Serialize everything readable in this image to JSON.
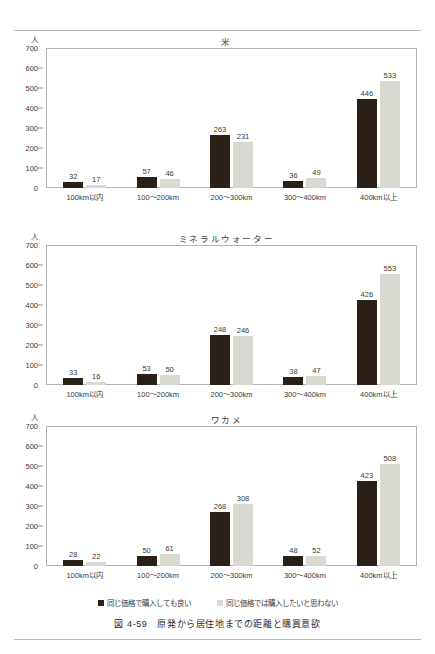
{
  "figure": {
    "caption_number": "図 4-59",
    "caption_text": "原発から居住地までの距離と購買意欲"
  },
  "legend": {
    "items": [
      {
        "label": "同じ価格で購入しても良い",
        "color": "#2b2018",
        "key": "same-price-willing"
      },
      {
        "label": "同じ価格では購入したいと思わない",
        "color": "#d9d9d1",
        "key": "same-price-unwilling"
      }
    ]
  },
  "axis": {
    "unit": "人",
    "yticks": [
      "700",
      "600",
      "500",
      "400",
      "300",
      "200",
      "100",
      "0"
    ],
    "categories": [
      "100km以内",
      "100〜200km",
      "200〜300km",
      "300〜400km",
      "400km以上"
    ]
  },
  "chart_data": [
    {
      "type": "bar",
      "title": "米",
      "xlabel": "",
      "ylabel": "人",
      "ylim": [
        0,
        700
      ],
      "yticks": [
        0,
        100,
        200,
        300,
        400,
        500,
        600,
        700
      ],
      "grid": false,
      "legend_position": "bottom",
      "categories": [
        "100km以内",
        "100〜200km",
        "200〜300km",
        "300〜400km",
        "400km以上"
      ],
      "series": [
        {
          "name": "同じ価格で購入しても良い",
          "color": "#2b2018",
          "values": [
            32,
            57,
            263,
            36,
            446
          ]
        },
        {
          "name": "同じ価格では購入したいと思わない",
          "color": "#d9d9d1",
          "values": [
            17,
            46,
            231,
            49,
            533
          ]
        }
      ]
    },
    {
      "type": "bar",
      "title": "ミネラルウォーター",
      "xlabel": "",
      "ylabel": "人",
      "ylim": [
        0,
        700
      ],
      "yticks": [
        0,
        100,
        200,
        300,
        400,
        500,
        600,
        700
      ],
      "grid": false,
      "legend_position": "bottom",
      "categories": [
        "100km以内",
        "100〜200km",
        "200〜300km",
        "300〜400km",
        "400km以上"
      ],
      "series": [
        {
          "name": "同じ価格で購入しても良い",
          "color": "#2b2018",
          "values": [
            33,
            53,
            248,
            38,
            426
          ]
        },
        {
          "name": "同じ価格では購入したいと思わない",
          "color": "#d9d9d1",
          "values": [
            16,
            50,
            246,
            47,
            553
          ]
        }
      ]
    },
    {
      "type": "bar",
      "title": "ワカメ",
      "xlabel": "",
      "ylabel": "人",
      "ylim": [
        0,
        700
      ],
      "yticks": [
        0,
        100,
        200,
        300,
        400,
        500,
        600,
        700
      ],
      "grid": false,
      "legend_position": "bottom",
      "categories": [
        "100km以内",
        "100〜200km",
        "200〜300km",
        "300〜400km",
        "400km以上"
      ],
      "series": [
        {
          "name": "同じ価格で購入しても良い",
          "color": "#2b2018",
          "values": [
            28,
            50,
            268,
            48,
            423
          ]
        },
        {
          "name": "同じ価格では購入したいと思わない",
          "color": "#d9d9d1",
          "values": [
            22,
            61,
            308,
            52,
            508
          ]
        }
      ]
    }
  ]
}
